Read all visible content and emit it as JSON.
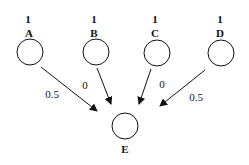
{
  "diagram": {
    "type": "neural-network",
    "input_nodes": [
      {
        "id": "A",
        "label": "A",
        "value": "1"
      },
      {
        "id": "B",
        "label": "B",
        "value": "1"
      },
      {
        "id": "C",
        "label": "C",
        "value": "1"
      },
      {
        "id": "D",
        "label": "D",
        "value": "1"
      }
    ],
    "output_node": {
      "id": "E",
      "label": "E"
    },
    "edges": [
      {
        "from": "A",
        "to": "E",
        "weight": "0.5"
      },
      {
        "from": "B",
        "to": "E",
        "weight": "0"
      },
      {
        "from": "C",
        "to": "E",
        "weight": "0"
      },
      {
        "from": "D",
        "to": "E",
        "weight": "0.5"
      }
    ],
    "colors": {
      "stroke": "#111111",
      "background": "#ffffff"
    }
  }
}
